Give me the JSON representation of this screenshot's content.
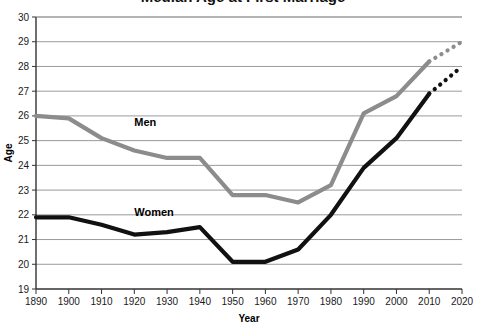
{
  "chart_data": {
    "type": "line",
    "title": "Median Age at First Marriage",
    "xlabel": "Year",
    "ylabel": "Age",
    "xlim": [
      1890,
      2020
    ],
    "ylim": [
      19,
      30
    ],
    "ytick_step": 1,
    "xtick_step": 10,
    "grid": "horizontal",
    "legend": "inline-labels",
    "x": [
      1890,
      1900,
      1910,
      1920,
      1930,
      1940,
      1950,
      1960,
      1970,
      1980,
      1990,
      2000,
      2010,
      2020
    ],
    "xticklabels": [
      "1890",
      "1900",
      "1910",
      "1920",
      "1930",
      "1940",
      "1950",
      "1960",
      "1970",
      "1980",
      "1990",
      "2000",
      "2010",
      "2020"
    ],
    "yticklabels": [
      "19",
      "20",
      "21",
      "22",
      "23",
      "24",
      "25",
      "26",
      "27",
      "28",
      "29",
      "30"
    ],
    "series": [
      {
        "name": "Men",
        "color": "#8c8c8c",
        "values": [
          26.0,
          25.9,
          25.1,
          24.6,
          24.3,
          24.3,
          22.8,
          22.8,
          22.5,
          23.2,
          26.1,
          26.8,
          28.2,
          29.0
        ],
        "solid_until": 2010,
        "projected_from": 2010,
        "projected_style": "dotted",
        "label": "Men",
        "label_x": 1920,
        "label_y": 25.6
      },
      {
        "name": "Women",
        "color": "#111111",
        "values": [
          21.9,
          21.9,
          21.6,
          21.2,
          21.3,
          21.5,
          20.1,
          20.1,
          20.6,
          22.0,
          23.9,
          25.1,
          26.9,
          28.0
        ],
        "solid_until": 2010,
        "projected_from": 2010,
        "projected_style": "dotted",
        "label": "Women",
        "label_x": 1920,
        "label_y": 21.95
      }
    ]
  }
}
